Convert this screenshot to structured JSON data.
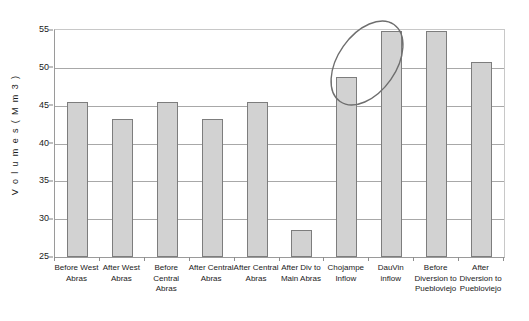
{
  "chart_data": {
    "type": "bar",
    "title": "",
    "subtitle": "",
    "xlabel": "",
    "ylabel": "V o l u m e s  ( M m 3 )",
    "ylim": [
      25,
      55
    ],
    "ytick_step": 5,
    "yticks": [
      "55",
      "50",
      "45",
      "40",
      "35",
      "30",
      "25"
    ],
    "grid": true,
    "legend": "none",
    "bar_color": "#d2d2d2",
    "bar_border_color": "#7d7d7d",
    "gridline_color": "#a8a8a8",
    "annotation_color": "#6e6e6e",
    "categories": [
      "Before West Abras",
      "After West Abras",
      "Before Central Abras",
      "After Central Abras",
      "After Central Abras",
      "After Div to Main Abras",
      "Chojampe Inflow",
      "DauVin inflow",
      "Before Diversion to Puebloviejo",
      "After Diversion to Puebloviejo"
    ],
    "category_lines": [
      [
        "Before West",
        "Abras"
      ],
      [
        "After West",
        "Abras"
      ],
      [
        "Before",
        "Central",
        "Abras"
      ],
      [
        "After Central",
        "Abras"
      ],
      [
        "After Central",
        "Abras"
      ],
      [
        "After Div to",
        "Main Abras"
      ],
      [
        "Chojampe",
        "Inflow"
      ],
      [
        "DauVin",
        "inflow"
      ],
      [
        "Before",
        "Diversion to",
        "Puebloviejo"
      ],
      [
        "After",
        "Diversion to",
        "Puebloviejo"
      ]
    ],
    "values": [
      45.5,
      43.2,
      45.5,
      43.2,
      45.5,
      28.6,
      48.8,
      54.9,
      54.9,
      50.8
    ],
    "annotations": [
      {
        "name": "highlight-ellipse",
        "shape": "ellipse",
        "covers": [
          "Chojampe Inflow",
          "DauVin inflow"
        ],
        "cx": 367,
        "cy": 63,
        "rx": 47,
        "ry": 29,
        "rotation_deg": -55
      }
    ]
  }
}
